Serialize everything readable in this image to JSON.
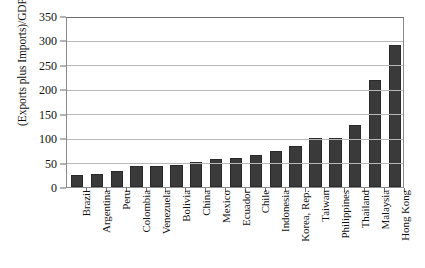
{
  "chart_data": {
    "type": "bar",
    "title": "",
    "xlabel": "",
    "ylabel": "(Exports plus Imports)/GDP",
    "ylim": [
      0,
      350
    ],
    "yticks": [
      0,
      50,
      100,
      150,
      200,
      250,
      300,
      350
    ],
    "grid": true,
    "legend": "none",
    "orientation": "vertical",
    "bar_color": "#3a3a3a",
    "categories": [
      "Brazil",
      "Argentina",
      "Peru",
      "Colombia",
      "Venezuela",
      "Bolivia",
      "China",
      "Mexico",
      "Ecuador",
      "Chile",
      "Indonesia",
      "Korea, Rep.",
      "Taiwan",
      "Philippines",
      "Thailand",
      "Malaysia",
      "Hong Kong"
    ],
    "values": [
      25,
      27,
      33,
      42,
      43,
      46,
      51,
      58,
      60,
      66,
      74,
      83,
      100,
      101,
      126,
      220,
      290
    ]
  }
}
